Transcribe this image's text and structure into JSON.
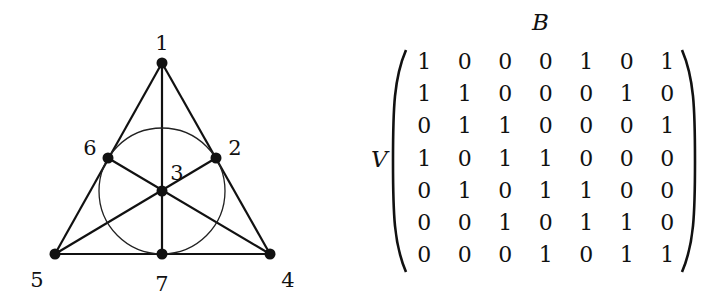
{
  "diagram": {
    "nodes": [
      {
        "id": "1",
        "label": "1",
        "x": 162,
        "y": 63,
        "lx": 162,
        "ly": 44
      },
      {
        "id": "2",
        "label": "2",
        "x": 216,
        "y": 158,
        "lx": 235,
        "ly": 149
      },
      {
        "id": "3",
        "label": "3",
        "x": 162,
        "y": 191,
        "lx": 177,
        "ly": 174
      },
      {
        "id": "4",
        "label": "4",
        "x": 270,
        "y": 254,
        "lx": 288,
        "ly": 281
      },
      {
        "id": "5",
        "label": "5",
        "x": 55,
        "y": 254,
        "lx": 37,
        "ly": 281
      },
      {
        "id": "6",
        "label": "6",
        "x": 108,
        "y": 158,
        "lx": 90,
        "ly": 149
      },
      {
        "id": "7",
        "label": "7",
        "x": 162,
        "y": 254,
        "lx": 162,
        "ly": 285
      }
    ],
    "lines": [
      [
        "1",
        "6",
        "5"
      ],
      [
        "1",
        "2",
        "4"
      ],
      [
        "5",
        "7",
        "4"
      ],
      [
        "1",
        "3",
        "7"
      ],
      [
        "6",
        "3",
        "4"
      ],
      [
        "2",
        "3",
        "5"
      ]
    ],
    "circle": {
      "cx": 162,
      "cy": 191,
      "r": 63,
      "through": [
        "6",
        "2",
        "7"
      ]
    }
  },
  "matrix": {
    "row_label": "V",
    "col_label": "B",
    "rows": [
      [
        "1",
        "0",
        "0",
        "0",
        "1",
        "0",
        "1"
      ],
      [
        "1",
        "1",
        "0",
        "0",
        "0",
        "1",
        "0"
      ],
      [
        "0",
        "1",
        "1",
        "0",
        "0",
        "0",
        "1"
      ],
      [
        "1",
        "0",
        "1",
        "1",
        "0",
        "0",
        "0"
      ],
      [
        "0",
        "1",
        "0",
        "1",
        "1",
        "0",
        "0"
      ],
      [
        "0",
        "0",
        "1",
        "0",
        "1",
        "1",
        "0"
      ],
      [
        "0",
        "0",
        "0",
        "1",
        "0",
        "1",
        "1"
      ]
    ]
  }
}
